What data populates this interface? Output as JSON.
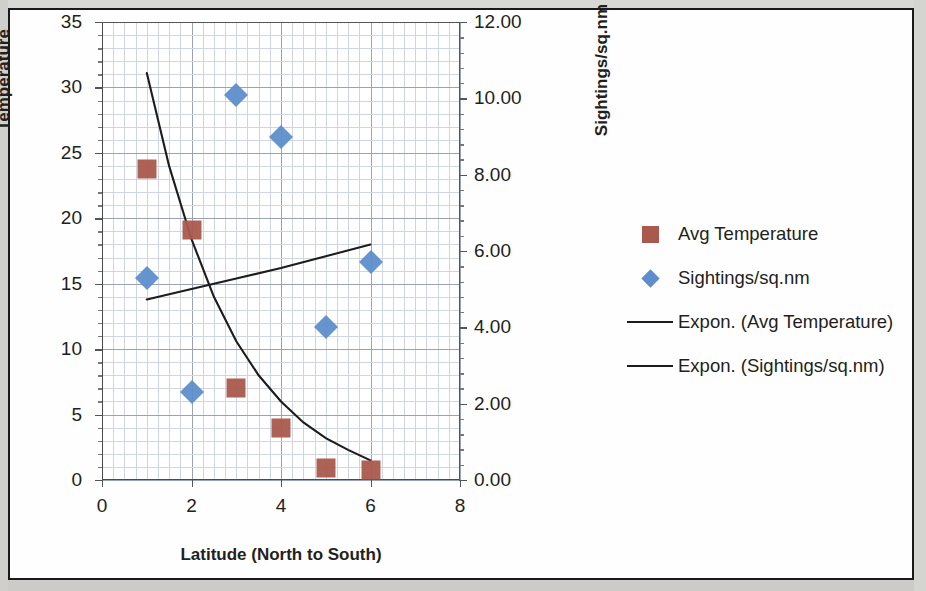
{
  "chart_data": {
    "type": "scatter",
    "title": "",
    "xlabel": "Latitude (North to South)",
    "ylabel": "Temperature",
    "y2label": "Sightings/sq.nm",
    "xlim": [
      0,
      8
    ],
    "xticks": [
      "0",
      "2",
      "4",
      "6",
      "8"
    ],
    "xtick_values": [
      0,
      2,
      4,
      6,
      8
    ],
    "ylim": [
      0,
      35
    ],
    "yticks": [
      "0",
      "5",
      "10",
      "15",
      "20",
      "25",
      "30",
      "35"
    ],
    "ytick_values": [
      0,
      5,
      10,
      15,
      20,
      25,
      30,
      35
    ],
    "y2lim": [
      0,
      12
    ],
    "y2ticks": [
      "0.00",
      "2.00",
      "4.00",
      "6.00",
      "8.00",
      "10.00",
      "12.00"
    ],
    "y2tick_values": [
      0,
      2,
      4,
      6,
      8,
      10,
      12
    ],
    "grid": true,
    "legend_position": "right",
    "series": [
      {
        "name": "Avg Temperature",
        "marker": "square",
        "color": "#a95a4c",
        "axis": "left",
        "x": [
          1,
          2,
          3,
          4,
          5,
          6
        ],
        "values": [
          23.8,
          19.1,
          7.0,
          4.0,
          0.9,
          0.8
        ]
      },
      {
        "name": "Sightings/sq.nm",
        "marker": "diamond",
        "color": "#5d8ecb",
        "axis": "right",
        "x": [
          1,
          2,
          3,
          4,
          5,
          6
        ],
        "values": [
          5.3,
          2.3,
          10.1,
          9.0,
          4.0,
          5.7
        ]
      },
      {
        "name": "Expon. (Avg Temperature)",
        "marker": "line",
        "color": "#1c1c1c",
        "axis": "left",
        "x": [
          1.0,
          1.5,
          2.0,
          2.5,
          3.0,
          3.5,
          4.0,
          4.5,
          5.0,
          5.5,
          6.0
        ],
        "values": [
          31.1,
          24.0,
          18.4,
          14.0,
          10.6,
          8.0,
          6.0,
          4.4,
          3.2,
          2.3,
          1.5
        ]
      },
      {
        "name": "Expon. (Sightings/sq.nm)",
        "marker": "line",
        "color": "#1c1c1c",
        "axis": "left",
        "x": [
          1.0,
          2.0,
          3.0,
          4.0,
          5.0,
          6.0
        ],
        "values": [
          13.8,
          14.6,
          15.4,
          16.2,
          17.1,
          18.0
        ]
      }
    ],
    "legend": [
      {
        "label": "Avg Temperature",
        "key": "square",
        "color": "#a95a4c"
      },
      {
        "label": "Sightings/sq.nm",
        "key": "diamond",
        "color": "#5d8ecb"
      },
      {
        "label": "Expon. (Avg Temperature)",
        "key": "line",
        "color": "#1c1c1c"
      },
      {
        "label": "Expon. (Sightings/sq.nm)",
        "key": "line",
        "color": "#1c1c1c"
      }
    ]
  }
}
